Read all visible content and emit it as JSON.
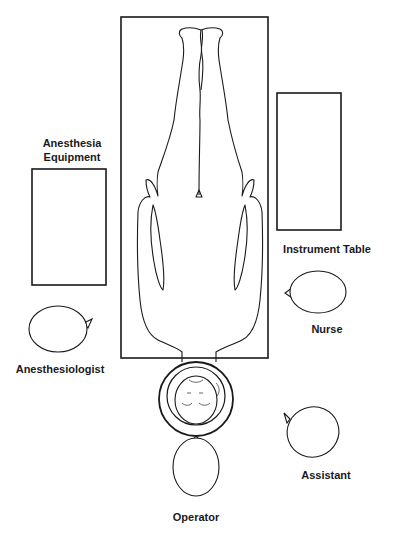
{
  "diagram": {
    "stroke_color": "#1a1a1a",
    "background": "#ffffff",
    "labels": {
      "anesthesia_equipment_line1": "Anesthesia",
      "anesthesia_equipment_line2": "Equipment",
      "instrument_table": "Instrument Table",
      "nurse": "Nurse",
      "anesthesiologist": "Anesthesiologist",
      "assistant": "Assistant",
      "operator": "Operator"
    },
    "objects": [
      {
        "name": "operating-table",
        "shape": "rect",
        "x": 121,
        "y": 17,
        "w": 147,
        "h": 341
      },
      {
        "name": "instrument-table",
        "shape": "rect",
        "x": 277,
        "y": 93,
        "w": 64,
        "h": 137
      },
      {
        "name": "anesthesia-equipment",
        "shape": "rect",
        "x": 32,
        "y": 169,
        "w": 74,
        "h": 116
      },
      {
        "name": "head-ring",
        "shape": "circle",
        "cx": 196,
        "cy": 399,
        "r": 37
      },
      {
        "name": "nurse-head",
        "shape": "ellipse",
        "cx": 318,
        "cy": 292,
        "rx": 28,
        "ry": 21,
        "facing": "left"
      },
      {
        "name": "anesthesiologist-head",
        "shape": "ellipse",
        "cx": 58,
        "cy": 329,
        "rx": 29,
        "ry": 23,
        "facing": "right"
      },
      {
        "name": "operator-head",
        "shape": "ellipse",
        "cx": 196,
        "cy": 467,
        "rx": 23,
        "ry": 29,
        "facing": "up"
      },
      {
        "name": "assistant-head",
        "shape": "ellipse",
        "cx": 313,
        "cy": 432,
        "rx": 26,
        "ry": 25,
        "facing": "up-left"
      }
    ]
  }
}
